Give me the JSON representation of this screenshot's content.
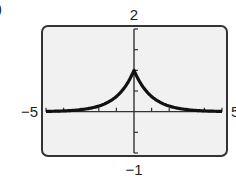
{
  "chart_data": {
    "type": "line",
    "title": "",
    "xlabel": "",
    "ylabel": "",
    "xlim": [
      -5,
      5
    ],
    "ylim": [
      -1,
      2
    ],
    "xscale": 1,
    "yscale": 0.5,
    "grid": false,
    "legend": null,
    "window_labels": {
      "xmin": "−5",
      "xmax": "5",
      "ymin": "−1",
      "ymax": "2"
    },
    "series": [
      {
        "name": "y = e^(-|x|)",
        "function": "exp(-abs(x))",
        "x": [
          -5,
          -4,
          -3,
          -2,
          -1,
          -0.5,
          0,
          0.5,
          1,
          2,
          3,
          4,
          5
        ],
        "y": [
          0.007,
          0.018,
          0.05,
          0.135,
          0.368,
          0.607,
          1,
          0.607,
          0.368,
          0.135,
          0.05,
          0.018,
          0.007
        ]
      }
    ]
  },
  "colors": {
    "frame": "#333333",
    "background": "#f1f1f1",
    "curve": "#111111",
    "axes": "#333333"
  },
  "panel_label": ")"
}
